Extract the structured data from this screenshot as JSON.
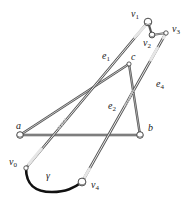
{
  "diagram": {
    "nodes": [
      {
        "id": "v1",
        "label": "v",
        "sub": "1",
        "x": 148,
        "y": 22,
        "r": 3.6
      },
      {
        "id": "v2",
        "label": "v",
        "sub": "2",
        "x": 152,
        "y": 35,
        "r": 2.8
      },
      {
        "id": "v3",
        "label": "v",
        "sub": "3",
        "x": 166,
        "y": 33,
        "r": 2.2
      },
      {
        "id": "c",
        "label": "c",
        "x": 129,
        "y": 64,
        "r": 2.2
      },
      {
        "id": "a",
        "label": "a",
        "x": 20,
        "y": 135,
        "r": 3.2
      },
      {
        "id": "b",
        "label": "b",
        "x": 140,
        "y": 135,
        "r": 3.2
      },
      {
        "id": "v0",
        "label": "v",
        "sub": "0",
        "x": 26,
        "y": 168,
        "r": 2.2
      },
      {
        "id": "v4",
        "label": "v",
        "sub": "4",
        "x": 82,
        "y": 182,
        "r": 3.8
      }
    ],
    "edges": [
      {
        "id": "e1",
        "label": "e",
        "sub": "1",
        "from": "v0",
        "to": "v1"
      },
      {
        "id": "e2",
        "label": "e",
        "sub": "2",
        "from": "v4",
        "to": "v3"
      },
      {
        "id": "ac",
        "from": "a",
        "to": "c"
      },
      {
        "id": "cb",
        "from": "c",
        "to": "b"
      },
      {
        "id": "ab",
        "from": "a",
        "to": "b"
      },
      {
        "id": "v1v2",
        "from": "v1",
        "to": "v2"
      },
      {
        "id": "v2v3",
        "from": "v2",
        "to": "v3"
      }
    ],
    "edge_labels": [
      {
        "text": "e",
        "sub": "1",
        "x": 102,
        "y": 59
      },
      {
        "text": "e",
        "sub": "4",
        "x": 156,
        "y": 87
      },
      {
        "text": "e",
        "sub": "2",
        "x": 108,
        "y": 109
      }
    ],
    "path": {
      "id": "gamma",
      "label": "γ",
      "x": 46,
      "y": 179
    },
    "labels": {
      "v1": {
        "x": 131,
        "y": 17
      },
      "v2": {
        "x": 143,
        "y": 46
      },
      "v3": {
        "x": 172,
        "y": 32
      },
      "c": {
        "x": 131,
        "y": 60
      },
      "a": {
        "x": 16,
        "y": 129
      },
      "b": {
        "x": 148,
        "y": 131
      },
      "v0": {
        "x": 9,
        "y": 165
      },
      "v4": {
        "x": 91,
        "y": 188
      }
    }
  }
}
